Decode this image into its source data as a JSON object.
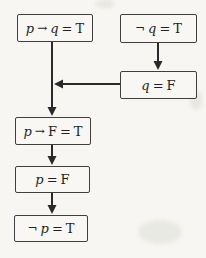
{
  "diagram": {
    "type": "flowchart",
    "colors": {
      "background": "#f7f6f2",
      "line": "#2a2a2a",
      "box_border": "#3f3f3f",
      "text": "#1f1f1f"
    },
    "nodes": [
      {
        "id": "premise-conditional",
        "label": "p → q = T",
        "tokens": [
          "p",
          "→",
          "q",
          "=",
          "T"
        ]
      },
      {
        "id": "premise-negation",
        "label": "¬q = T",
        "tokens": [
          "¬",
          "q",
          "=",
          "T"
        ]
      },
      {
        "id": "step-q-false",
        "label": "q = F",
        "tokens": [
          "q",
          "=",
          "F"
        ]
      },
      {
        "id": "step-substitution",
        "label": "p → F = T",
        "tokens": [
          "p",
          "→",
          "F",
          "=",
          "T"
        ]
      },
      {
        "id": "step-p-false",
        "label": "p = F",
        "tokens": [
          "p",
          "=",
          "F"
        ]
      },
      {
        "id": "conclusion-not-p",
        "label": "¬p = T",
        "tokens": [
          "¬",
          "p",
          "=",
          "T"
        ]
      }
    ],
    "edges": [
      {
        "from": "premise-conditional",
        "to": "step-substitution",
        "direction": "down"
      },
      {
        "from": "premise-negation",
        "to": "step-q-false",
        "direction": "down"
      },
      {
        "from": "step-q-false",
        "to": "step-substitution",
        "direction": "left"
      },
      {
        "from": "step-substitution",
        "to": "step-p-false",
        "direction": "down"
      },
      {
        "from": "step-p-false",
        "to": "conclusion-not-p",
        "direction": "down"
      }
    ]
  }
}
